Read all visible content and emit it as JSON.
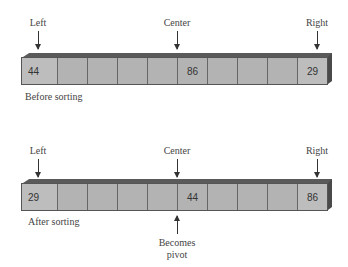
{
  "diagrams": [
    {
      "caption": "Before sorting",
      "pointers": {
        "left": "Left",
        "center": "Center",
        "right": "Right"
      },
      "cells": [
        "44",
        "",
        "",
        "",
        "",
        "86",
        "",
        "",
        "",
        "29"
      ]
    },
    {
      "caption": "After sorting",
      "pointers": {
        "left": "Left",
        "center": "Center",
        "right": "Right"
      },
      "cells": [
        "29",
        "",
        "",
        "",
        "",
        "44",
        "",
        "",
        "",
        "86"
      ],
      "annotation": {
        "line1": "Becomes",
        "line2": "pivot"
      }
    }
  ],
  "colors": {
    "cell": "#b3b3b3",
    "border": "#555555",
    "bar_top": "#5a5a5a"
  }
}
